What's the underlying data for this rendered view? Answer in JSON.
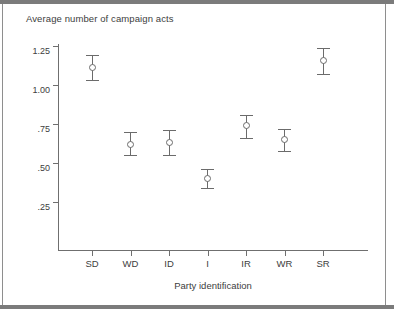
{
  "chart_data": {
    "type": "scatter",
    "title": "Average number of campaign acts",
    "xlabel": "Party identification",
    "ylabel": "",
    "categories": [
      "SD",
      "WD",
      "ID",
      "I",
      "IR",
      "WR",
      "SR"
    ],
    "values": [
      1.11,
      0.62,
      0.63,
      0.4,
      0.74,
      0.65,
      1.16
    ],
    "error_low": [
      1.03,
      0.55,
      0.55,
      0.34,
      0.66,
      0.58,
      1.07
    ],
    "error_high": [
      1.19,
      0.7,
      0.71,
      0.46,
      0.81,
      0.72,
      1.24
    ],
    "ylim": [
      0.17,
      1.3
    ],
    "ytick_values": [
      1.25,
      1.0,
      0.75,
      0.5,
      0.25
    ],
    "ytick_labels": [
      "1.25",
      "1.00",
      ".75",
      ".50",
      ".25"
    ],
    "grid": false,
    "legend": "none",
    "marker": "open-circle",
    "errorbar_style": "capped-vertical"
  },
  "figure": {
    "title": "Average number of campaign acts",
    "x_axis_title": "Party identification",
    "colors": {
      "axis": "#6f6f6f",
      "marker": "#6b6b6b",
      "text": "#3d3d3d",
      "frame": "#7b7b7b",
      "background": "#ffffff"
    }
  }
}
